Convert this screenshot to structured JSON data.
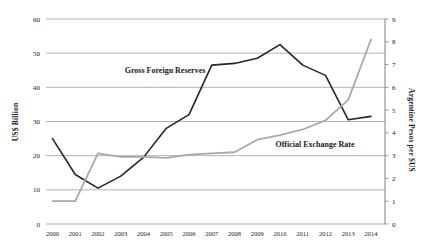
{
  "chart_data": {
    "type": "line",
    "categories": [
      "2000",
      "2001",
      "2002",
      "2003",
      "2004",
      "2005",
      "2006",
      "2007",
      "2008",
      "2009",
      "2010",
      "2011",
      "2012",
      "2013",
      "2014"
    ],
    "series": [
      {
        "name": "Gross Foreign Reserves",
        "label": "Gross Foreign Reserves",
        "axis": "left",
        "color": "#262626",
        "stroke_width": 1.6,
        "values": [
          25,
          14.5,
          10.5,
          14,
          19.5,
          28,
          32,
          46.5,
          47,
          48.5,
          52.5,
          46.5,
          43.5,
          30.5,
          31.5
        ]
      },
      {
        "name": "Official Exchange Rate",
        "label": "Official Exchange Rate",
        "axis": "right",
        "color": "#a9a9a9",
        "stroke_width": 1.8,
        "values": [
          1.0,
          1.0,
          3.1,
          2.95,
          2.95,
          2.9,
          3.05,
          3.1,
          3.15,
          3.7,
          3.9,
          4.15,
          4.55,
          5.45,
          8.1
        ]
      }
    ],
    "left_axis": {
      "title": "US$ Billion",
      "min": 0,
      "max": 60,
      "step": 10,
      "tick_labels": [
        "0",
        "10",
        "20",
        "30",
        "40",
        "50",
        "60"
      ]
    },
    "right_axis": {
      "title": "Argentine Pesos per $US",
      "min": 0,
      "max": 9,
      "step": 1,
      "tick_labels": [
        "0",
        "1",
        "2",
        "3",
        "4",
        "5",
        "6",
        "7",
        "8",
        "9"
      ]
    },
    "title": "",
    "xlabel": "",
    "grid": "horizontal",
    "legend_position": "inline-annotations",
    "colors": {
      "gridline": "#a0a0a0",
      "axis_line": "#808080",
      "tick_text": "#1a1a1a"
    }
  }
}
